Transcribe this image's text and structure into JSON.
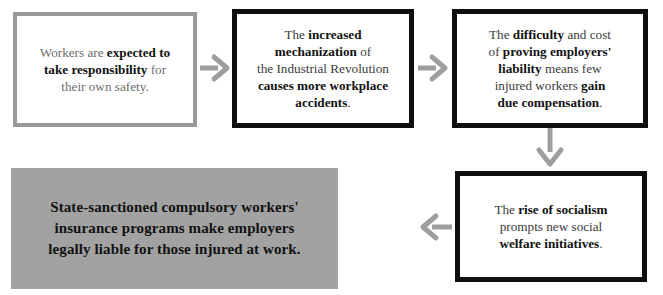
{
  "diagram": {
    "type": "flowchart",
    "background_color": "#ffffff",
    "colors": {
      "outline_gray": "#9a9a9a",
      "outline_black": "#0f0f0f",
      "fill_gray": "#a2a2a2",
      "arrow_gray": "#9e9e9e",
      "text_gray": "#6d6d6d",
      "text_dark": "#3b3b3b",
      "text_bold": "#111111"
    },
    "nodes": [
      {
        "id": "node-1",
        "style": "gray-outline",
        "lines": [
          [
            {
              "t": "Workers are ",
              "b": false
            },
            {
              "t": "expected to",
              "b": true
            }
          ],
          [
            {
              "t": "take responsibility",
              "b": true
            },
            {
              "t": " for",
              "b": false
            }
          ],
          [
            {
              "t": "their own safety.",
              "b": false
            }
          ]
        ],
        "plain_text": "Workers are expected to take responsibility for their own safety."
      },
      {
        "id": "node-2",
        "style": "black-outline",
        "lines": [
          [
            {
              "t": "The ",
              "b": false
            },
            {
              "t": "increased",
              "b": true
            }
          ],
          [
            {
              "t": "mechanization",
              "b": true
            },
            {
              "t": " of",
              "b": false
            }
          ],
          [
            {
              "t": "the Industrial Revolution",
              "b": false
            }
          ],
          [
            {
              "t": "causes more workplace",
              "b": true
            }
          ],
          [
            {
              "t": "accidents",
              "b": true
            },
            {
              "t": ".",
              "b": false
            }
          ]
        ],
        "plain_text": "The increased mechanization of the Industrial Revolution causes more workplace accidents."
      },
      {
        "id": "node-3",
        "style": "black-outline",
        "lines": [
          [
            {
              "t": "The ",
              "b": false
            },
            {
              "t": "difficulty",
              "b": true
            },
            {
              "t": " and cost",
              "b": false
            }
          ],
          [
            {
              "t": "of ",
              "b": false
            },
            {
              "t": "proving employers'",
              "b": true
            }
          ],
          [
            {
              "t": "liability",
              "b": true
            },
            {
              "t": " means few",
              "b": false
            }
          ],
          [
            {
              "t": "injured workers ",
              "b": false
            },
            {
              "t": "gain",
              "b": true
            }
          ],
          [
            {
              "t": "due compensation",
              "b": true
            },
            {
              "t": ".",
              "b": false
            }
          ]
        ],
        "plain_text": "The difficulty and cost of proving employers' liability means few injured workers gain due compensation."
      },
      {
        "id": "node-4",
        "style": "black-outline",
        "lines": [
          [
            {
              "t": "The ",
              "b": false
            },
            {
              "t": "rise of socialism",
              "b": true
            }
          ],
          [
            {
              "t": "prompts new social",
              "b": false
            }
          ],
          [
            {
              "t": "welfare initiatives",
              "b": true
            },
            {
              "t": ".",
              "b": false
            }
          ]
        ],
        "plain_text": "The rise of socialism prompts new social welfare initiatives."
      },
      {
        "id": "node-5",
        "style": "filled",
        "lines": [
          [
            {
              "t": "State-sanctioned compulsory workers'",
              "b": true
            }
          ],
          [
            {
              "t": "insurance programs make employers",
              "b": true
            }
          ],
          [
            {
              "t": "legally liable for those injured at work.",
              "b": true
            }
          ]
        ],
        "plain_text": "State-sanctioned compulsory workers' insurance programs make employers legally liable for those injured at work."
      }
    ],
    "arrows": [
      {
        "id": "arrow-1",
        "from": "node-1",
        "to": "node-2",
        "direction": "right"
      },
      {
        "id": "arrow-2",
        "from": "node-2",
        "to": "node-3",
        "direction": "right"
      },
      {
        "id": "arrow-3",
        "from": "node-3",
        "to": "node-4",
        "direction": "down"
      },
      {
        "id": "arrow-4",
        "from": "node-4",
        "to": "node-5",
        "direction": "left"
      }
    ]
  }
}
